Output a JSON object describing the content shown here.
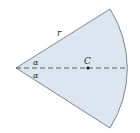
{
  "diagram": {
    "type": "circular-sector",
    "labels": {
      "radius": "r",
      "angle_top": "α",
      "angle_bottom": "α",
      "centroid": "C"
    },
    "colors": {
      "fill": "#dbe6f0",
      "stroke": "#6a6a6a",
      "axis": "#3a3a3a"
    }
  }
}
